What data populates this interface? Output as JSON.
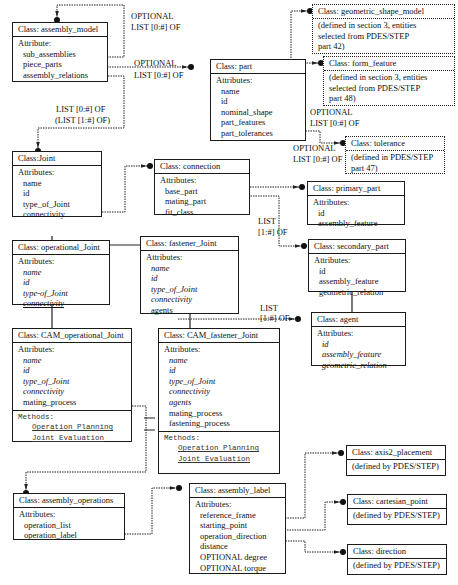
{
  "classes": {
    "assembly_model": {
      "title": "Class: assembly_model",
      "section": "Attribute:",
      "attrs": [
        "sub_assemblies",
        "piece_parts",
        "assembly_relations"
      ]
    },
    "part": {
      "title": "Class: part",
      "section": "Attributes:",
      "attrs": [
        "name",
        "id",
        "nominal_shape",
        "part_features",
        "part_tolerances"
      ]
    },
    "geometric_shape_model": {
      "title": "Class: geometric_shape_model",
      "desc": [
        "(defined in section 3, entities",
        "selected from PDES/STEP",
        "part 42)"
      ]
    },
    "form_feature": {
      "title": "Class: form_feature",
      "desc": [
        "(defined in section 3, entities",
        "selected from PDES/STEP",
        "part 48)"
      ]
    },
    "tolerance": {
      "title": "Class: tolerance",
      "desc": [
        "(defined in  PDES/STEP",
        "part 47)"
      ]
    },
    "joint": {
      "title": "Class:Joint",
      "section": "Attributes:",
      "attrs": [
        "name",
        "id",
        "type_of_Joint",
        "connectivity"
      ]
    },
    "connection": {
      "title": "Class: connection",
      "section": "Attributes:",
      "attrs": [
        "base_part",
        "mating_part",
        "fit_class"
      ]
    },
    "primary_part": {
      "title": "Class: primary_part",
      "section": "Attributes:",
      "attrs": [
        "id",
        "assembly_feature"
      ]
    },
    "secondary_part": {
      "title": "Class: secondary_part",
      "section": "Attributes:",
      "attrs": [
        "id",
        "assembly_feature",
        "geometric_relation"
      ]
    },
    "operational_joint": {
      "title": "Class: operational_Joint",
      "section": "Attributes:",
      "attrs": [
        "name",
        "id",
        "type-of_Joint",
        "connectivity"
      ]
    },
    "fastener_joint": {
      "title": "Class: fastener_Joint",
      "section": "Attributes:",
      "attrs": [
        "name",
        "id",
        "type_of_Joint",
        "connectivity",
        "agents"
      ]
    },
    "agent": {
      "title": "Class: agent",
      "section": "Attributes:",
      "attrs": [
        "id",
        "assembly_feature",
        "geometric_relation"
      ]
    },
    "cam_operational_joint": {
      "title": "Class: CAM_operational_Joint",
      "section": "Attributes:",
      "attrs": [
        "name",
        "id",
        "type_of_Joint",
        "connectivity",
        "mating_process"
      ],
      "methods_label": "Methods:",
      "methods": [
        "Operation Planning",
        "Joint Evaluation"
      ]
    },
    "cam_fastener_joint": {
      "title": "Class: CAM_fastener_Joint",
      "section": "Attributes:",
      "attrs": [
        "name",
        "id",
        "type_of_Joint",
        "connectivity",
        "agents",
        "mating_process",
        "fastening_process"
      ],
      "methods_label": "Methods:",
      "methods": [
        "Operation Planning",
        "Joint Evaluation"
      ]
    },
    "assembly_operations": {
      "title": "Class: assembly_operations",
      "section": "Attributes:",
      "attrs": [
        "operation_list",
        "operation_label"
      ]
    },
    "assembly_label": {
      "title": "Class: assembly_label",
      "section": "Attributes:",
      "attrs": [
        "reference_frame",
        "starting_point",
        "operation_direction",
        "distance",
        "OPTIONAL degree",
        "OPTIONAL torque"
      ]
    },
    "axis2_placement": {
      "title": "Class: axis2_placement",
      "desc": [
        "(defined by PDES/STEP)"
      ]
    },
    "cartesian_point": {
      "title": "Class: cartesian_point",
      "desc": [
        "(defined by PDES/STEP)"
      ]
    },
    "direction": {
      "title": "Class: direction",
      "desc": [
        "(defined by PDES/STEP)"
      ]
    }
  },
  "labels": {
    "sub_assemblies_1": "OPTIONAL",
    "sub_assemblies_2": "LIST [0:#] OF",
    "piece_parts_1": "OPTIONAL",
    "piece_parts_2": "LIST [0:#] OF",
    "relations_1": "LIST [0:#] OF",
    "relations_2": "(LIST [1:#] OF)",
    "features_1": "OPTIONAL",
    "features_2": "LIST [0:#] OF",
    "tolerances_1": "OPTIONAL",
    "tolerances_2": "LIST [0:#] OF",
    "mating_1": "LIST",
    "mating_2": "[1:#] OF",
    "agents_1": "LIST",
    "agents_2": "[1:#] OF"
  }
}
